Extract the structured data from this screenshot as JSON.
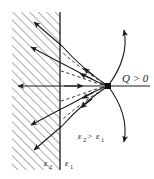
{
  "figure": {
    "name": "point-charge-near-dielectric-interface",
    "labels": {
      "charge": "Q > 0",
      "epsilon_left": "ε",
      "epsilon_left_sub": "2",
      "epsilon_right": "ε",
      "epsilon_right_sub": "1",
      "relation_eps": "ε",
      "relation_sub_a": "2",
      "relation_gt": ">",
      "relation_eps_b": "ε",
      "relation_sub_b": "1"
    },
    "colors": {
      "stroke": "#1a1a1a",
      "hatch": "#8d8d8d",
      "dashed": "#3a3a3a",
      "background": "#ffffff",
      "charge_fill": "#101010"
    },
    "geometry": {
      "interface_x": 60,
      "charge_x": 108,
      "charge_y": 86,
      "hatch_left": 12,
      "hatch_top": 12,
      "hatch_bottom": 170
    }
  }
}
